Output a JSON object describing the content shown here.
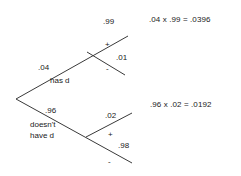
{
  "diagram": {
    "type": "probability-tree",
    "root": {
      "branches": [
        {
          "probability": ".04",
          "label": "has d",
          "children": [
            {
              "probability": ".99",
              "sign": "+"
            },
            {
              "probability": ".01",
              "sign": "-"
            }
          ],
          "result": ".04 x .99 = .0396"
        },
        {
          "probability": ".96",
          "label_line1": "doesn't",
          "label_line2": "have d",
          "children": [
            {
              "probability": ".02",
              "sign": "+"
            },
            {
              "probability": ".98",
              "sign": "-"
            }
          ],
          "result": ".96 x .02 = .0192"
        }
      ]
    },
    "colors": {
      "line": "#3a3a3a",
      "text": "#1a1a1a",
      "background": "#ffffff"
    }
  }
}
